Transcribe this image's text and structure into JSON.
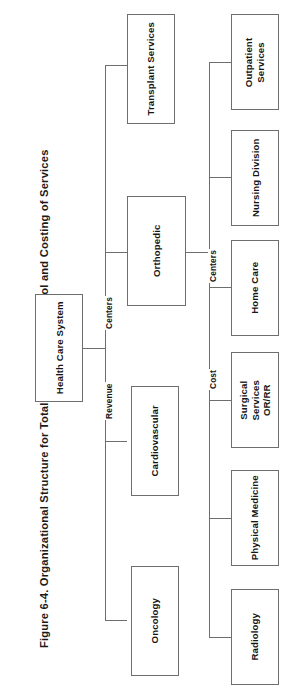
{
  "figure": {
    "caption": "Figure 6-4.  Organizational Structure for Total Product Line Control and Costing of Services"
  },
  "diagram": {
    "type": "organizational-chart",
    "orientation": "rotated-90-counterclockwise",
    "root": {
      "id": "health-care-system",
      "label": "Health Care System"
    },
    "edge_labels": [
      {
        "id": "revenue",
        "label": "Revenue"
      },
      {
        "id": "centers-left",
        "label": "Centers"
      },
      {
        "id": "cost",
        "label": "Cost"
      },
      {
        "id": "centers-right",
        "label": "Centers"
      }
    ],
    "level2": [
      {
        "id": "oncology",
        "label": "Oncology"
      },
      {
        "id": "cardiovascular",
        "label": "Cardiovascular"
      },
      {
        "id": "orthopedic",
        "label": "Orthopedic"
      },
      {
        "id": "transplant-services",
        "label": "Transplant Services"
      }
    ],
    "level3": [
      {
        "id": "radiology",
        "label": "Radiology"
      },
      {
        "id": "physical-medicine",
        "label": "Physical Medicine"
      },
      {
        "id": "surgical-services",
        "label": "Surgical Services\nOR/RR"
      },
      {
        "id": "home-care",
        "label": "Home Care"
      },
      {
        "id": "nursing-division",
        "label": "Nursing Division"
      },
      {
        "id": "outpatient-services",
        "label": "Outpatient\nServices"
      }
    ],
    "colors": {
      "line": "#6e6e6e",
      "box_fill": "#ffffff",
      "text": "#151515",
      "page": "#ffffff"
    }
  }
}
